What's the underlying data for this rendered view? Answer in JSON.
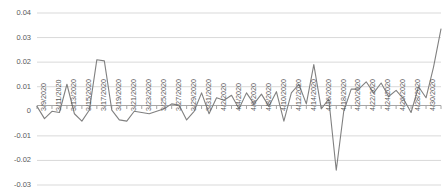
{
  "chart_data": {
    "type": "line",
    "title": "",
    "subtitle": "",
    "xlabel": "",
    "ylabel": "",
    "grid": true,
    "legend": false,
    "legend_position": "none",
    "line_color": "#808080",
    "gridline_color": "#d9d9d9",
    "axis_color": "#a6a6a6",
    "tick_label_color": "#595959",
    "ylim": [
      -0.03,
      0.04
    ],
    "yticks": [
      0.04,
      0.03,
      0.02,
      0.01,
      0,
      -0.01,
      -0.02,
      -0.03
    ],
    "ytick_labels": [
      "0.04",
      "0.03",
      "0.02",
      "0.01",
      "0",
      "-0.01",
      "-0.02",
      "-0.03"
    ],
    "xtick_labels": [
      "3/9/2020",
      "3/11/2020",
      "3/13/2020",
      "3/15/2020",
      "3/17/2020",
      "3/19/2020",
      "3/21/2020",
      "3/23/2020",
      "3/25/2020",
      "3/27/2020",
      "3/29/2020",
      "3/31/2020",
      "4/2/2020",
      "4/4/2020",
      "4/6/2020",
      "4/8/2020",
      "4/10/2020",
      "4/12/2020",
      "4/14/2020",
      "4/16/2020",
      "4/18/2020",
      "4/20/2020",
      "4/22/2020",
      "4/24/2020",
      "4/26/2020",
      "4/28/2020",
      "4/30/2020",
      "5/2/2020"
    ],
    "categories": [
      "3/9/2020",
      "3/10/2020",
      "3/11/2020",
      "3/12/2020",
      "3/13/2020",
      "3/14/2020",
      "3/15/2020",
      "3/16/2020",
      "3/17/2020",
      "3/18/2020",
      "3/19/2020",
      "3/20/2020",
      "3/21/2020",
      "3/22/2020",
      "3/23/2020",
      "3/24/2020",
      "3/25/2020",
      "3/26/2020",
      "3/27/2020",
      "3/28/2020",
      "3/29/2020",
      "3/30/2020",
      "3/31/2020",
      "4/1/2020",
      "4/2/2020",
      "4/3/2020",
      "4/4/2020",
      "4/5/2020",
      "4/6/2020",
      "4/7/2020",
      "4/8/2020",
      "4/9/2020",
      "4/10/2020",
      "4/11/2020",
      "4/12/2020",
      "4/13/2020",
      "4/14/2020",
      "4/15/2020",
      "4/16/2020",
      "4/17/2020",
      "4/18/2020",
      "4/19/2020",
      "4/20/2020",
      "4/21/2020",
      "4/22/2020",
      "4/23/2020",
      "4/24/2020",
      "4/25/2020",
      "4/26/2020",
      "4/27/2020",
      "4/28/2020",
      "4/29/2020",
      "4/30/2020",
      "5/1/2020",
      "5/2/2020"
    ],
    "series": [
      {
        "name": "value",
        "values": [
          0.002,
          -0.003,
          0.0,
          -0.0005,
          0.011,
          -0.001,
          -0.004,
          0.0005,
          0.021,
          0.0205,
          0.0005,
          -0.0035,
          -0.004,
          0.0,
          -0.0005,
          -0.001,
          0.0,
          0.001,
          0.003,
          0.0025,
          -0.0035,
          0.0,
          0.0075,
          -0.001,
          0.0055,
          0.0045,
          0.0065,
          0.001,
          0.0075,
          0.003,
          0.007,
          0.002,
          0.008,
          -0.004,
          0.0075,
          0.011,
          0.003,
          0.019,
          0.001,
          0.005,
          -0.024,
          0.0,
          0.009,
          0.009,
          0.012,
          0.0075,
          0.0115,
          0.006,
          0.0085,
          0.005,
          -0.0005,
          0.01,
          0.0055,
          0.018,
          0.0335
        ]
      }
    ]
  }
}
